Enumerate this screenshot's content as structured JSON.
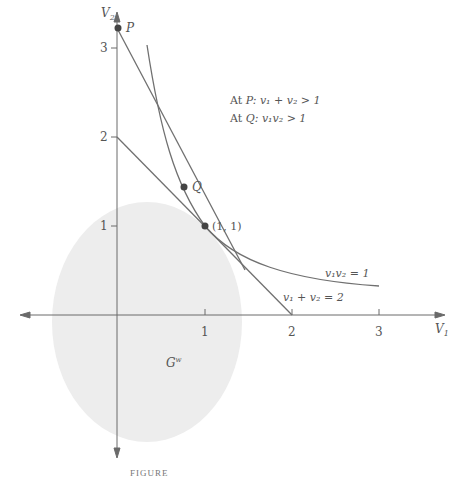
{
  "colors": {
    "axis": "#6a6a6a",
    "line": "#707070",
    "point": "#444444",
    "region": "#ededed",
    "text": "#555555"
  },
  "axes": {
    "x_label": "V",
    "x_label_sub": "1",
    "y_label": "V",
    "y_label_sub": "2",
    "x_ticks": [
      "1",
      "2",
      "3"
    ],
    "y_ticks": [
      "1",
      "2",
      "3"
    ]
  },
  "points": {
    "P": "P",
    "Q": "Q",
    "tangent": "(1, 1)"
  },
  "annotations": {
    "line1_prefix": "At ",
    "line1_point": "P",
    "line1_cond": ": v₁ + v₂ > 1",
    "line2_prefix": "At ",
    "line2_point": "Q",
    "line2_cond": ": v₁v₂ > 1"
  },
  "curve_labels": {
    "hyperbola": "v₁v₂ = 1",
    "line": "v₁ + v₂ = 2"
  },
  "region_label": "G",
  "region_label_sup": "w",
  "caption": "FIGURE"
}
